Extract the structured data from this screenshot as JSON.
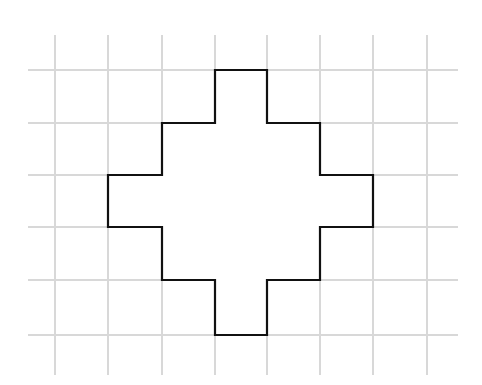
{
  "figure": {
    "background_color": "#ffffff",
    "canvas": {
      "width": 482,
      "height": 385
    }
  },
  "grid": {
    "line_color": "#d8d8d8",
    "line_width": 1.1,
    "cell_size_x": 52.8,
    "cell_size_y": 53.0,
    "vertical_lines_x": [
      55,
      108,
      162,
      215,
      267,
      320,
      373,
      427
    ],
    "horizontal_lines_y": [
      70,
      123,
      175,
      227,
      280,
      335
    ],
    "vertical_extent_y": [
      35,
      375
    ],
    "horizontal_extent_x": [
      28,
      458
    ]
  },
  "chart_data": {
    "type": "scatter",
    "xlabel": "",
    "ylabel": "",
    "grid": true,
    "legend": "none",
    "xlim": [
      0,
      5
    ],
    "ylim": [
      0,
      5
    ],
    "shape": {
      "name": "stepped-cross-polygon",
      "stroke_color": "#111111",
      "fill_color": "#ffffff",
      "stroke_width": 2.2,
      "closed": true,
      "grid_units_wide": 5,
      "grid_units_tall": 5,
      "area_in_cells": 21,
      "perimeter_in_units": 28,
      "vertices_grid": [
        [
          2,
          0
        ],
        [
          3,
          0
        ],
        [
          3,
          1
        ],
        [
          4,
          1
        ],
        [
          4,
          2
        ],
        [
          5,
          2
        ],
        [
          5,
          3
        ],
        [
          4,
          3
        ],
        [
          4,
          4
        ],
        [
          3,
          4
        ],
        [
          3,
          5
        ],
        [
          2,
          5
        ],
        [
          2,
          4
        ],
        [
          1,
          4
        ],
        [
          1,
          3
        ],
        [
          0,
          3
        ],
        [
          0,
          2
        ],
        [
          1,
          2
        ],
        [
          1,
          1
        ],
        [
          2,
          1
        ]
      ],
      "vertices_pixels": [
        [
          215,
          70
        ],
        [
          267,
          70
        ],
        [
          267,
          123
        ],
        [
          320,
          123
        ],
        [
          320,
          175
        ],
        [
          373,
          175
        ],
        [
          373,
          227
        ],
        [
          320,
          227
        ],
        [
          320,
          280
        ],
        [
          267,
          280
        ],
        [
          267,
          335
        ],
        [
          215,
          335
        ],
        [
          215,
          280
        ],
        [
          162,
          280
        ],
        [
          162,
          227
        ],
        [
          108,
          227
        ],
        [
          108,
          175
        ],
        [
          162,
          175
        ],
        [
          162,
          123
        ],
        [
          215,
          123
        ]
      ],
      "bounding_box_pixels": {
        "x": 108,
        "y": 70,
        "width": 265,
        "height": 265
      }
    }
  }
}
